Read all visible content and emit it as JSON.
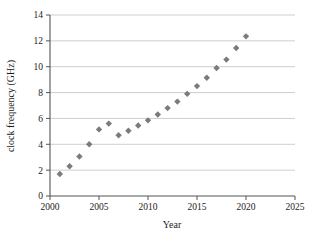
{
  "figure": {
    "clipped_title_fragment": "",
    "background_color": "#ffffff",
    "marker_color": "#7b7b7b",
    "gridline_color": "#b9b9b9",
    "axis_color": "#555555"
  },
  "chart_data": {
    "type": "scatter",
    "title": "",
    "xlabel": "Year",
    "ylabel": "clock frequency (GHz)",
    "xlim": [
      2000,
      2025
    ],
    "ylim": [
      0,
      14
    ],
    "xticks": [
      2000,
      2005,
      2010,
      2015,
      2020,
      2025
    ],
    "xtick_labels": [
      "2000",
      "2005",
      "2010",
      "2015",
      "2020",
      "2025"
    ],
    "yticks": [
      0,
      2,
      4,
      6,
      8,
      10,
      12,
      14
    ],
    "ytick_labels": [
      "0",
      "2",
      "4",
      "6",
      "8",
      "10",
      "12",
      "14"
    ],
    "grid": "horizontal",
    "legend": "none",
    "marker_shape": "diamond",
    "series": [
      {
        "name": "clock frequency",
        "x": [
          2001,
          2002,
          2003,
          2004,
          2005,
          2006,
          2007,
          2008,
          2009,
          2010,
          2011,
          2012,
          2013,
          2014,
          2015,
          2016,
          2017,
          2018,
          2019,
          2020
        ],
        "values": [
          1.7,
          2.3,
          3.05,
          4.0,
          5.15,
          5.6,
          4.7,
          5.05,
          5.45,
          5.85,
          6.3,
          6.8,
          7.3,
          7.9,
          8.5,
          9.15,
          9.9,
          10.55,
          11.45,
          12.35
        ]
      }
    ]
  }
}
